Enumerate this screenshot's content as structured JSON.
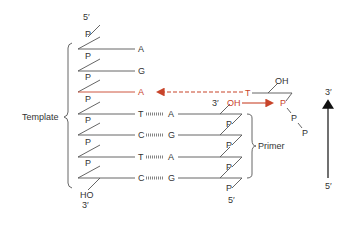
{
  "colors": {
    "line": "#555555",
    "accent": "#c8442a",
    "text": "#333333"
  },
  "labels": {
    "template": "Template",
    "primer": "Primer",
    "five_prime": "5′",
    "three_prime": "3′",
    "phosphate": "P",
    "hydroxyl": "OH",
    "ho": "HO"
  },
  "template_strand": {
    "top_end": "5′",
    "bottom_end": "3′",
    "bottom_group": "HO",
    "bases": [
      "A",
      "G",
      "A",
      "T",
      "C",
      "T",
      "C"
    ]
  },
  "primer_strand": {
    "top_end": "3′",
    "top_group": "OH",
    "bottom_end": "5′",
    "bases": [
      "A",
      "G",
      "A",
      "G"
    ]
  },
  "incoming_nucleotide": {
    "base": "T",
    "sugar_group": "OH",
    "phosphates": [
      "P",
      "P",
      "P"
    ]
  },
  "direction_arrow": {
    "top": "3′",
    "bottom": "5′"
  }
}
